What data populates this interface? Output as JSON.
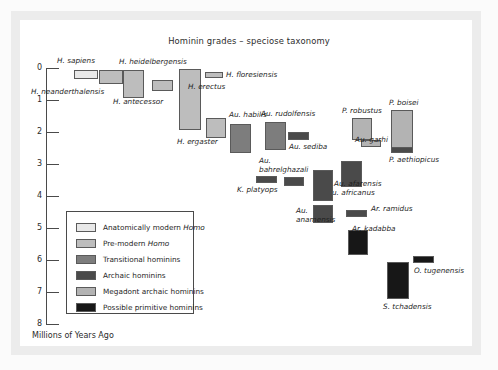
{
  "figure": {
    "title": "Hominin grades – speciose taxonomy",
    "axis_caption": "Millions of Years Ago"
  },
  "chart_data": {
    "type": "bar",
    "orientation": "vertical-range",
    "title": "Hominin grades – speciose taxonomy",
    "xlabel": "",
    "ylabel": "Millions of Years Ago",
    "ylim": [
      0,
      8
    ],
    "y_inverted": true,
    "grid": false,
    "y_ticks": [
      0,
      1,
      2,
      3,
      4,
      5,
      6,
      7,
      8
    ],
    "y_tick_labels": [
      "0",
      "1",
      "2",
      "3",
      "4",
      "5",
      "6",
      "7",
      "8"
    ],
    "legend_position": "inside-lower-left",
    "categories": [
      "H. sapiens",
      "H. neanderthalensis",
      "H. heidelbergensis",
      "H. antecessor",
      "H. erectus",
      "H. floresiensis",
      "H. ergaster",
      "Au. habilis",
      "Au. rudolfensis",
      "Au. sediba",
      "Au. bahrelghazali",
      "K. platyops",
      "Au. africanus",
      "Au. afarensis",
      "Au. anamensis",
      "P. robustus",
      "Au. garhi",
      "P. boisei",
      "P. aethiopicus",
      "Ar. ramidus",
      "Ar. kadabba",
      "S. tchadensis",
      "O. tugenensis"
    ],
    "series": [
      {
        "name": "range_start_mya",
        "values": [
          0.2,
          0.4,
          0.9,
          0.7,
          1.9,
          0.2,
          2.1,
          2.6,
          2.5,
          2.2,
          3.6,
          3.6,
          3.2,
          4.1,
          4.7,
          2.2,
          2.5,
          2.6,
          2.6,
          4.6,
          5.8,
          7.2,
          6.1
        ]
      },
      {
        "name": "range_end_mya",
        "values": [
          0.0,
          0.06,
          0.1,
          0.4,
          0.03,
          0.05,
          1.5,
          1.6,
          1.7,
          1.95,
          3.3,
          3.4,
          2.1,
          3.0,
          3.9,
          1.5,
          2.3,
          1.3,
          2.4,
          4.4,
          5.2,
          6.1,
          5.9
        ]
      }
    ],
    "grade_of": [
      "Anatomically modern Homo",
      "Pre-modern Homo",
      "Pre-modern Homo",
      "Pre-modern Homo",
      "Pre-modern Homo",
      "Pre-modern Homo",
      "Pre-modern Homo",
      "Transitional hominins",
      "Transitional hominins",
      "Archaic hominins",
      "Archaic hominins",
      "Archaic hominins",
      "Archaic hominins",
      "Archaic hominins",
      "Archaic hominins",
      "Megadont archaic hominins",
      "Megadont archaic hominins",
      "Megadont archaic hominins",
      "Archaic hominins",
      "Archaic hominins",
      "Possible primitive hominins",
      "Possible primitive hominins",
      "Possible primitive hominins"
    ]
  },
  "bars": [
    {
      "name": "H. sapiens",
      "label": "H. sapiens",
      "cls": "c-amh",
      "x": 74,
      "y": 70,
      "w": 24,
      "h": 9,
      "lx": 57,
      "ly": 57
    },
    {
      "name": "H. neanderthalensis",
      "label": "H. neanderthalensis",
      "cls": "c-pre",
      "x": 99,
      "y": 70,
      "w": 24,
      "h": 14,
      "lx": 31,
      "ly": 88
    },
    {
      "name": "H. heidelbergensis",
      "label": "H. heidelbergensis",
      "cls": "c-pre",
      "x": 123,
      "y": 70,
      "w": 21,
      "h": 28,
      "lx": 119,
      "ly": 58
    },
    {
      "name": "H. antecessor",
      "label": "H. antecessor",
      "cls": "c-pre",
      "x": 152,
      "y": 80,
      "w": 21,
      "h": 11,
      "lx": 113,
      "ly": 98
    },
    {
      "name": "H. erectus",
      "label": "H. erectus",
      "cls": "c-pre",
      "x": 179,
      "y": 69,
      "w": 22,
      "h": 61,
      "lx": 188,
      "ly": 83
    },
    {
      "name": "H. floresiensis",
      "label": "H. floresiensis",
      "cls": "c-pre",
      "x": 205,
      "y": 72,
      "w": 18,
      "h": 6,
      "lx": 226,
      "ly": 71
    },
    {
      "name": "H. ergaster",
      "label": "H. ergaster",
      "cls": "c-pre",
      "x": 206,
      "y": 118,
      "w": 20,
      "h": 20,
      "lx": 177,
      "ly": 138
    },
    {
      "name": "Au. habilis",
      "label": "Au. habilis",
      "cls": "c-trans",
      "x": 230,
      "y": 124,
      "w": 21,
      "h": 29,
      "lx": 229,
      "ly": 111
    },
    {
      "name": "Au. rudolfensis",
      "label": "Au. rudolfensis",
      "cls": "c-trans",
      "x": 265,
      "y": 122,
      "w": 21,
      "h": 28,
      "lx": 261,
      "ly": 110
    },
    {
      "name": "Au. sediba",
      "label": "Au. sediba",
      "cls": "c-arch",
      "x": 288,
      "y": 132,
      "w": 21,
      "h": 8,
      "lx": 289,
      "ly": 143
    },
    {
      "name": "Au. bahrelghazali",
      "label": "Au.",
      "cls": "c-arch",
      "x": 284,
      "y": 177,
      "w": 20,
      "h": 9,
      "lx": 259,
      "ly": 157
    },
    {
      "name": "K. platyops",
      "label": "K. platyops",
      "cls": "c-arch",
      "x": 256,
      "y": 176,
      "w": 21,
      "h": 7,
      "lx": 237,
      "ly": 186
    },
    {
      "name": "Au. africanus",
      "label": "Au. africanus",
      "cls": "c-arch",
      "x": 341,
      "y": 161,
      "w": 21,
      "h": 26,
      "lx": 327,
      "ly": 189
    },
    {
      "name": "Au. afarensis",
      "label": "Au. afarensis",
      "cls": "c-arch",
      "x": 313,
      "y": 170,
      "w": 20,
      "h": 31,
      "lx": 334,
      "ly": 180
    },
    {
      "name": "Au. anamensis",
      "label": "Au.",
      "cls": "c-arch",
      "x": 313,
      "y": 205,
      "w": 20,
      "h": 18,
      "lx": 296,
      "ly": 207
    },
    {
      "name": "P. robustus",
      "label": "P. robustus",
      "cls": "c-mega",
      "x": 352,
      "y": 118,
      "w": 20,
      "h": 22,
      "lx": 342,
      "ly": 107
    },
    {
      "name": "Au. garhi",
      "label": "Au. garhi",
      "cls": "c-mega",
      "x": 361,
      "y": 140,
      "w": 20,
      "h": 7,
      "lx": 355,
      "ly": 136
    },
    {
      "name": "P. boisei",
      "label": "P. boisei",
      "cls": "c-mega",
      "x": 391,
      "y": 110,
      "w": 22,
      "h": 42,
      "lx": 389,
      "ly": 99
    },
    {
      "name": "P. aethiopicus",
      "label": "P. aethiopicus",
      "cls": "c-arch",
      "x": 391,
      "y": 147,
      "w": 22,
      "h": 6,
      "lx": 389,
      "ly": 156
    },
    {
      "name": "Ar. ramidus",
      "label": "Ar. ramidus",
      "cls": "c-arch",
      "x": 346,
      "y": 210,
      "w": 21,
      "h": 7,
      "lx": 371,
      "ly": 205
    },
    {
      "name": "Ar. kadabba",
      "label": "Ar. kadabba",
      "cls": "c-prim",
      "x": 348,
      "y": 230,
      "w": 20,
      "h": 25,
      "lx": 352,
      "ly": 225
    },
    {
      "name": "S. tchadensis",
      "label": "S. tchadensis",
      "cls": "c-prim",
      "x": 387,
      "y": 262,
      "w": 22,
      "h": 37,
      "lx": 383,
      "ly": 303
    },
    {
      "name": "O. tugenensis",
      "label": "O. tugenensis",
      "cls": "c-prim",
      "x": 413,
      "y": 256,
      "w": 21,
      "h": 7,
      "lx": 414,
      "ly": 267
    }
  ],
  "extra_labels": [
    {
      "name": "label-au-bahrelghazali-2",
      "text": "bahrelghazali",
      "lx": 259,
      "ly": 166
    },
    {
      "name": "label-au-anamensis-2",
      "text": "anamensis",
      "lx": 296,
      "ly": 216
    }
  ],
  "y_axis": {
    "ticks": [
      {
        "value": "0",
        "y": 68
      },
      {
        "value": "1",
        "y": 100
      },
      {
        "value": "2",
        "y": 132
      },
      {
        "value": "3",
        "y": 164
      },
      {
        "value": "4",
        "y": 196
      },
      {
        "value": "5",
        "y": 228
      },
      {
        "value": "6",
        "y": 260
      },
      {
        "value": "7",
        "y": 292
      },
      {
        "value": "8",
        "y": 324
      }
    ]
  },
  "legend": {
    "items": [
      {
        "label": "Anatomically modern ",
        "emph": "Homo",
        "cls": "c-amh"
      },
      {
        "label": "Pre-modern ",
        "emph": "Homo",
        "cls": "c-pre"
      },
      {
        "label": "Transitional hominins",
        "emph": "",
        "cls": "c-trans"
      },
      {
        "label": "Archaic hominins",
        "emph": "",
        "cls": "c-arch"
      },
      {
        "label": "Megadont archaic hominins",
        "emph": "",
        "cls": "c-mega"
      },
      {
        "label": "Possible primitive hominins",
        "emph": "",
        "cls": "c-prim"
      }
    ]
  },
  "colors": {
    "anatomically_modern_homo": "#e8e8e8",
    "pre_modern_homo": "#bdbdbd",
    "transitional_hominins": "#7d7d7d",
    "archaic_hominins": "#4a4a4a",
    "megadont_archaic_hominins": "#b3b3b3",
    "possible_primitive_hominins": "#171717",
    "axis": "#4a4a4a",
    "text": "#1f1f1f",
    "page_background": "#ffffff"
  }
}
